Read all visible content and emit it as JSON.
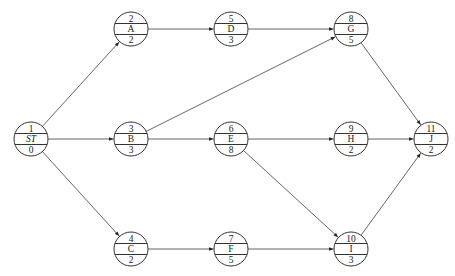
{
  "diagram": {
    "type": "activity-on-node network",
    "node_radius": 17,
    "nodes": [
      {
        "id": "1",
        "label": "ST",
        "duration": "0",
        "x": 31,
        "y": 139,
        "italic": true
      },
      {
        "id": "2",
        "label": "A",
        "duration": "2",
        "x": 131,
        "y": 29
      },
      {
        "id": "3",
        "label": "B",
        "duration": "3",
        "x": 131,
        "y": 139
      },
      {
        "id": "4",
        "label": "C",
        "duration": "2",
        "x": 131,
        "y": 249
      },
      {
        "id": "5",
        "label": "D",
        "duration": "3",
        "x": 231,
        "y": 29
      },
      {
        "id": "6",
        "label": "E",
        "duration": "8",
        "x": 231,
        "y": 139
      },
      {
        "id": "7",
        "label": "F",
        "duration": "5",
        "x": 231,
        "y": 249
      },
      {
        "id": "8",
        "label": "G",
        "duration": "5",
        "x": 351,
        "y": 29
      },
      {
        "id": "9",
        "label": "H",
        "duration": "2",
        "x": 351,
        "y": 139
      },
      {
        "id": "10",
        "label": "I",
        "duration": "3",
        "x": 351,
        "y": 249
      },
      {
        "id": "11",
        "label": "J",
        "duration": "2",
        "x": 431,
        "y": 139
      }
    ],
    "edges": [
      {
        "from": "1",
        "to": "2"
      },
      {
        "from": "1",
        "to": "3"
      },
      {
        "from": "1",
        "to": "4"
      },
      {
        "from": "2",
        "to": "5"
      },
      {
        "from": "5",
        "to": "8"
      },
      {
        "from": "3",
        "to": "8"
      },
      {
        "from": "3",
        "to": "6"
      },
      {
        "from": "6",
        "to": "9"
      },
      {
        "from": "6",
        "to": "10"
      },
      {
        "from": "4",
        "to": "7"
      },
      {
        "from": "7",
        "to": "10"
      },
      {
        "from": "8",
        "to": "11"
      },
      {
        "from": "9",
        "to": "11"
      },
      {
        "from": "10",
        "to": "11"
      }
    ],
    "colors": {
      "stroke": "#333333",
      "edge": "#555555",
      "text": "#222222",
      "background": "#ffffff"
    }
  }
}
